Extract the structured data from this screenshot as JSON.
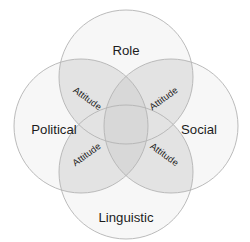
{
  "diagram": {
    "type": "venn",
    "title": "",
    "background_color": "#ffffff",
    "outline_color": "#b3b3b3",
    "circle_fill_color": "#f7f7f7",
    "overlap_fill_color": "#e3e3e3",
    "center_overlap_color": "#d8d8d8",
    "text_color": "#1c1c1c",
    "sets": [
      {
        "key": "role",
        "label": "Role",
        "position": "top",
        "cx": 126,
        "cy": 77,
        "r": 67,
        "label_x": 126,
        "label_y": 52
      },
      {
        "key": "political",
        "label": "Political",
        "position": "left",
        "cx": 81,
        "cy": 126,
        "r": 67,
        "label_x": 54,
        "label_y": 131
      },
      {
        "key": "social",
        "label": "Social",
        "position": "right",
        "cx": 171,
        "cy": 126,
        "r": 67,
        "label_x": 199,
        "label_y": 131
      },
      {
        "key": "linguistic",
        "label": "Linguistic",
        "position": "bottom",
        "cx": 126,
        "cy": 172,
        "r": 67,
        "label_x": 126,
        "label_y": 219
      }
    ],
    "intersections": [
      {
        "key": "role-political",
        "label": "Attitude",
        "sets": [
          "role",
          "political"
        ],
        "x": 87,
        "y": 99,
        "rotation": 36
      },
      {
        "key": "role-social",
        "label": "Attitude",
        "sets": [
          "role",
          "social"
        ],
        "x": 164,
        "y": 99,
        "rotation": -36
      },
      {
        "key": "political-linguistic",
        "label": "Attitude",
        "sets": [
          "political",
          "linguistic"
        ],
        "x": 87,
        "y": 155,
        "rotation": -36
      },
      {
        "key": "social-linguistic",
        "label": "Attitude",
        "sets": [
          "social",
          "linguistic"
        ],
        "x": 164,
        "y": 155,
        "rotation": 36
      }
    ]
  }
}
